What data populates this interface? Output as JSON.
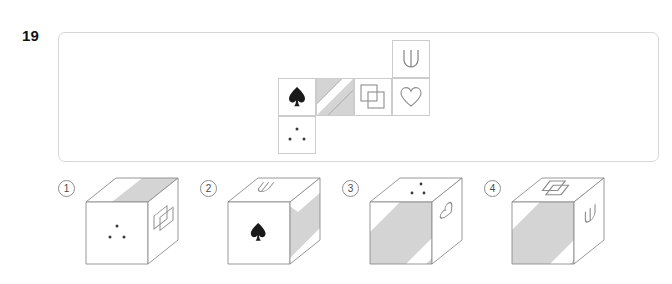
{
  "page": {
    "question_number": "19",
    "type": "cube-folding-spatial-reasoning"
  },
  "colors": {
    "panel_border": "#d7d7d7",
    "cell_border": "#cccccc",
    "shade_gray": "#d4d4d4",
    "line": "#8d8d8d",
    "symbol_stroke": "#7a7a7a",
    "spade_fill": "#1a1a1a",
    "text": "#111111"
  },
  "net": {
    "label": "cube-net",
    "grid_cols": 4,
    "grid_rows": 3,
    "cells": [
      {
        "id": "net-cell-trident",
        "row": 0,
        "col": 3,
        "symbol": "trident-icon",
        "symbol_label": "trident"
      },
      {
        "id": "net-cell-spade",
        "row": 1,
        "col": 0,
        "symbol": "spade-icon",
        "symbol_label": "spade"
      },
      {
        "id": "net-cell-diagonal-band",
        "row": 1,
        "col": 1,
        "symbol": "diagonal-band-icon",
        "symbol_label": "gray face with white diagonal band"
      },
      {
        "id": "net-cell-squares",
        "row": 1,
        "col": 2,
        "symbol": "overlapping-squares-icon",
        "symbol_label": "two overlapping squares"
      },
      {
        "id": "net-cell-heart",
        "row": 1,
        "col": 3,
        "symbol": "heart-icon",
        "symbol_label": "heart outline"
      },
      {
        "id": "net-cell-dots",
        "row": 2,
        "col": 0,
        "symbol": "three-dots-icon",
        "symbol_label": "three dots triangle"
      }
    ]
  },
  "options": [
    {
      "id": "option-1",
      "number": "1",
      "faces": {
        "top": "diagonal-band-icon",
        "front": "three-dots-icon",
        "right": "overlapping-squares-icon"
      }
    },
    {
      "id": "option-2",
      "number": "2",
      "faces": {
        "top": "trident-icon",
        "front": "spade-icon",
        "right": "diagonal-band-icon"
      }
    },
    {
      "id": "option-3",
      "number": "3",
      "faces": {
        "top": "three-dots-icon",
        "front": "diagonal-band-icon",
        "right": "heart-icon"
      }
    },
    {
      "id": "option-4",
      "number": "4",
      "faces": {
        "top": "overlapping-squares-icon",
        "front": "diagonal-band-icon",
        "right": "trident-icon"
      }
    }
  ]
}
